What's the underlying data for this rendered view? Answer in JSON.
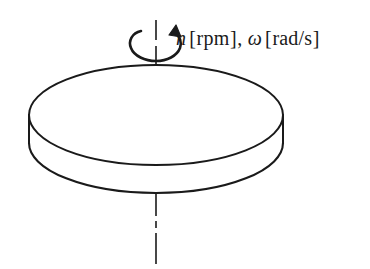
{
  "figure": {
    "type": "engineering-diagram",
    "background_color": "#ffffff",
    "line_color": "#1a1a1a",
    "width": 370,
    "height": 269
  },
  "label": {
    "speed_symbol": "n",
    "speed_unit_open": "[",
    "speed_unit": "rpm",
    "speed_unit_close": "]",
    "separator": ",",
    "angular_symbol": "ω",
    "angular_unit_open": "[",
    "angular_unit": "rad/s",
    "angular_unit_close": "]",
    "full_text": "n [rpm], ω [rad/s]"
  },
  "parts": {
    "disk_name": "disk-body",
    "top_face_name": "disk-top-face",
    "side_wall_name": "disk-side-wall",
    "axis_name": "rotation-axis-centerline",
    "arrow_name": "rotation-direction-arrow"
  },
  "geometry": {
    "disk_center_x": 156,
    "disk_top_center_y": 115,
    "disk_radius_x": 127,
    "disk_radius_y": 50,
    "disk_thickness": 28,
    "axis_top_y": 20,
    "axis_bottom_y": 264
  }
}
